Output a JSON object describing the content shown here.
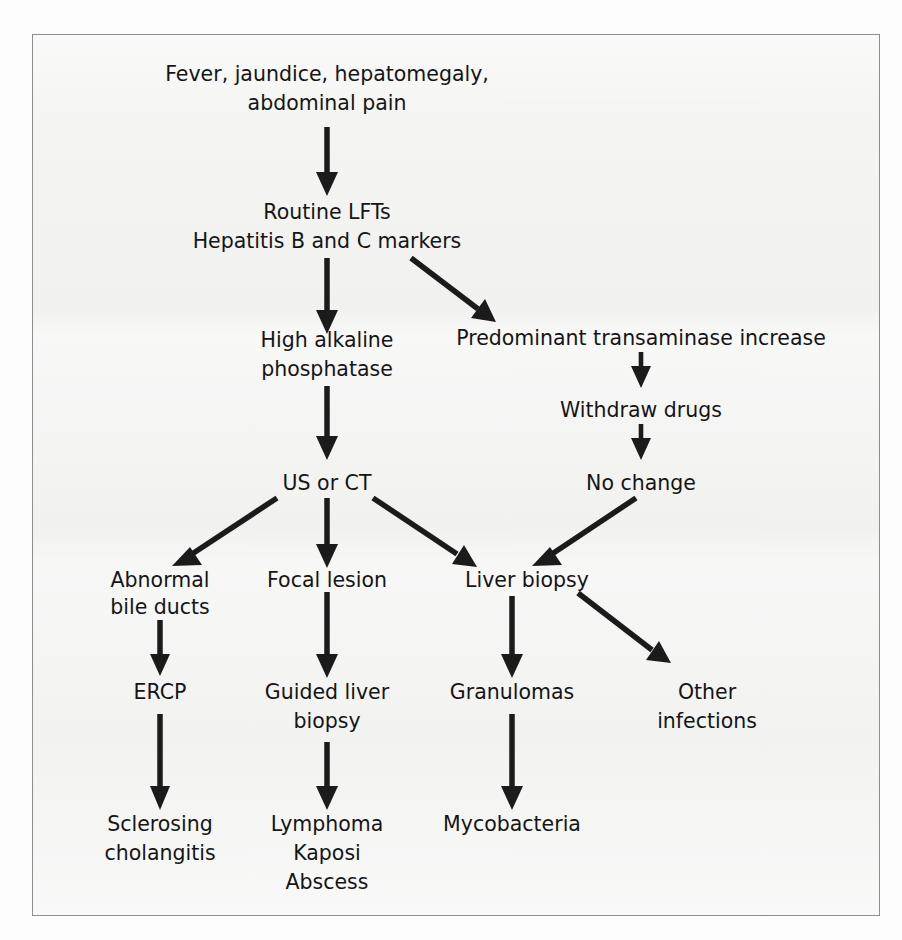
{
  "diagram": {
    "type": "flowchart",
    "background_color": "#f4f4f3",
    "border_color": "#8e8e8e",
    "text_color": "#151515",
    "arrow_color": "#1b1b1b",
    "nodes": [
      {
        "id": "symptoms",
        "lines": [
          "Fever, jaundice, hepatomegaly,",
          "abdominal pain"
        ]
      },
      {
        "id": "tests",
        "lines": [
          "Routine LFTs",
          "Hepatitis B and C markers"
        ]
      },
      {
        "id": "alp",
        "lines": [
          "High alkaline",
          "phosphatase"
        ]
      },
      {
        "id": "transaminase",
        "lines": [
          "Predominant transaminase increase"
        ]
      },
      {
        "id": "withdraw",
        "lines": [
          "Withdraw drugs"
        ]
      },
      {
        "id": "nochange",
        "lines": [
          "No change"
        ]
      },
      {
        "id": "usct",
        "lines": [
          "US or CT"
        ]
      },
      {
        "id": "bileducts",
        "lines": [
          "Abnormal",
          "bile ducts"
        ]
      },
      {
        "id": "focal",
        "lines": [
          "Focal lesion"
        ]
      },
      {
        "id": "liverbiopsy",
        "lines": [
          "Liver biopsy"
        ]
      },
      {
        "id": "ercp",
        "lines": [
          "ERCP"
        ]
      },
      {
        "id": "guided",
        "lines": [
          "Guided liver",
          "biopsy"
        ]
      },
      {
        "id": "granulomas",
        "lines": [
          "Granulomas"
        ]
      },
      {
        "id": "otherinf",
        "lines": [
          "Other",
          "infections"
        ]
      },
      {
        "id": "sclerosing",
        "lines": [
          "Sclerosing",
          "cholangitis"
        ]
      },
      {
        "id": "lymphoma",
        "lines": [
          "Lymphoma",
          "Kaposi",
          "Abscess"
        ]
      },
      {
        "id": "mycobacteria",
        "lines": [
          "Mycobacteria"
        ]
      }
    ],
    "edges": [
      {
        "from": "symptoms",
        "to": "tests",
        "kind": "down"
      },
      {
        "from": "tests",
        "to": "alp",
        "kind": "down"
      },
      {
        "from": "tests",
        "to": "transaminase",
        "kind": "diagonal-right"
      },
      {
        "from": "transaminase",
        "to": "withdraw",
        "kind": "down"
      },
      {
        "from": "withdraw",
        "to": "nochange",
        "kind": "down"
      },
      {
        "from": "alp",
        "to": "usct",
        "kind": "down"
      },
      {
        "from": "usct",
        "to": "bileducts",
        "kind": "diagonal-left"
      },
      {
        "from": "usct",
        "to": "focal",
        "kind": "down"
      },
      {
        "from": "usct",
        "to": "liverbiopsy",
        "kind": "diagonal-right"
      },
      {
        "from": "nochange",
        "to": "liverbiopsy",
        "kind": "diagonal-left"
      },
      {
        "from": "bileducts",
        "to": "ercp",
        "kind": "down"
      },
      {
        "from": "focal",
        "to": "guided",
        "kind": "down"
      },
      {
        "from": "liverbiopsy",
        "to": "granulomas",
        "kind": "down"
      },
      {
        "from": "liverbiopsy",
        "to": "otherinf",
        "kind": "diagonal-right"
      },
      {
        "from": "ercp",
        "to": "sclerosing",
        "kind": "down"
      },
      {
        "from": "guided",
        "to": "lymphoma",
        "kind": "down"
      },
      {
        "from": "granulomas",
        "to": "mycobacteria",
        "kind": "down"
      }
    ]
  },
  "labels": {
    "symptoms_l1": "Fever, jaundice, hepatomegaly,",
    "symptoms_l2": "abdominal pain",
    "tests_l1": "Routine LFTs",
    "tests_l2": "Hepatitis B and C markers",
    "alp_l1": "High alkaline",
    "alp_l2": "phosphatase",
    "transaminase_l1": "Predominant transaminase increase",
    "withdraw_l1": "Withdraw drugs",
    "nochange_l1": "No change",
    "usct_l1": "US or CT",
    "bileducts_l1": "Abnormal",
    "bileducts_l2": "bile ducts",
    "focal_l1": "Focal lesion",
    "liverbiopsy_l1": "Liver biopsy",
    "ercp_l1": "ERCP",
    "guided_l1": "Guided liver",
    "guided_l2": "biopsy",
    "granulomas_l1": "Granulomas",
    "otherinf_l1": "Other",
    "otherinf_l2": "infections",
    "sclerosing_l1": "Sclerosing",
    "sclerosing_l2": "cholangitis",
    "lymphoma_l1": "Lymphoma",
    "lymphoma_l2": "Kaposi",
    "lymphoma_l3": "Abscess",
    "mycobacteria_l1": "Mycobacteria"
  }
}
